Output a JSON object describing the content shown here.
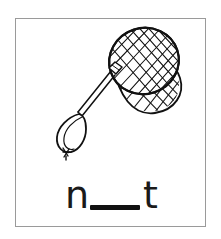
{
  "card": {
    "type": "phonics-worksheet-card",
    "background_color": "#ffffff",
    "frame_color": "#9a9a9a"
  },
  "illustration": {
    "name": "butterfly-net",
    "alt_label": "net",
    "line_color": "#111111",
    "fill_color": "#ffffff",
    "parts": [
      "mesh-hoop",
      "mesh-bag",
      "ferrule-collar",
      "handle-shaft",
      "handle-loop",
      "cord-knot"
    ]
  },
  "prompt": {
    "first_letter": "n",
    "blank": "",
    "last_letter": "t",
    "answer_length": 1,
    "text_color": "#1a1a1a",
    "blank_color": "#111111"
  }
}
